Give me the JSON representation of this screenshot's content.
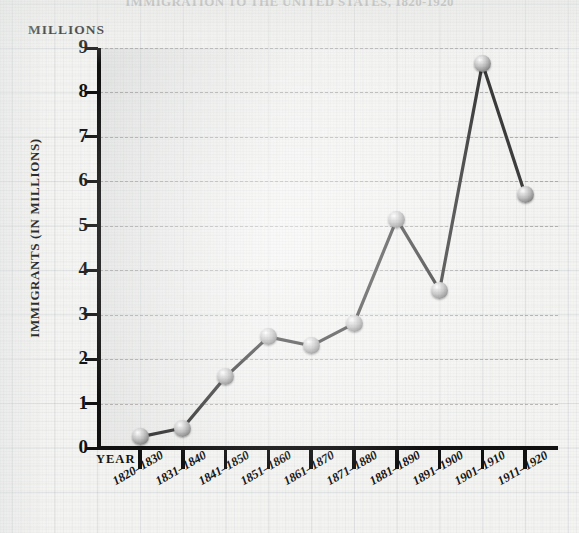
{
  "chart_data": {
    "type": "line",
    "title": "IMMIGRATION TO THE UNITED STATES, 1820-1920",
    "axis_unit_header": "MILLIONS",
    "xlabel": "YEAR",
    "ylabel": "IMMIGRANTS (IN MILLIONS)",
    "categories": [
      "1820–1830",
      "1831–1840",
      "1841–1850",
      "1851–1860",
      "1861–1870",
      "1871–1880",
      "1881–1890",
      "1891–1900",
      "1901–1910",
      "1911–1920"
    ],
    "values": [
      0.25,
      0.45,
      1.6,
      2.5,
      2.3,
      2.8,
      5.15,
      3.55,
      8.65,
      5.7
    ],
    "ylim": [
      0,
      9
    ],
    "yticks": [
      "0",
      "1",
      "2",
      "3",
      "4",
      "5",
      "6",
      "7",
      "8",
      "9"
    ],
    "grid": true,
    "legend": "none",
    "marker_style": "3d-sphere",
    "line_color": "#3a3a3a",
    "text_color": "#141414",
    "background_color": "#f4f4f2"
  }
}
